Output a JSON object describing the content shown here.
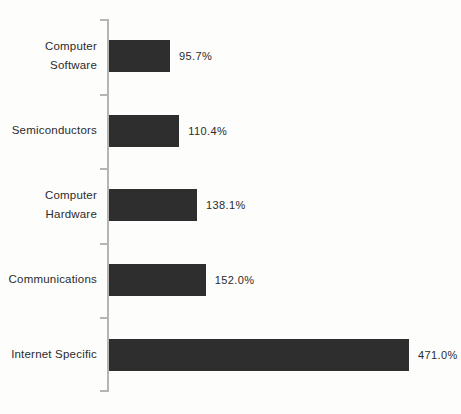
{
  "chart_data": {
    "type": "bar",
    "orientation": "horizontal",
    "title": "",
    "xlabel": "",
    "ylabel": "",
    "grid": false,
    "legend": null,
    "categories": [
      "Computer Software",
      "Semiconductors",
      "Computer Hardware",
      "Communications",
      "Internet Specific"
    ],
    "values": [
      95.7,
      110.4,
      138.1,
      152.0,
      471.0
    ],
    "value_labels": [
      "95.7%",
      "110.4%",
      "138.1%",
      "152.0%",
      "471.0%"
    ],
    "value_axis_max": 471.0,
    "bar_color": "#2e2e2e",
    "axis_color": "#b5b5b3",
    "text_color": "#2b2b2b",
    "background_color": "#fdfdfc"
  }
}
